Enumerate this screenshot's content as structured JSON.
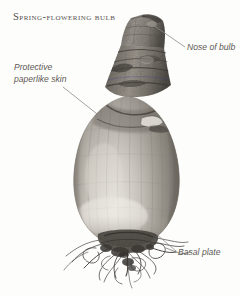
{
  "figure": {
    "title": "Spring-flowering bulb",
    "background_color": "#fdfdfc",
    "text_color": "#5d5955",
    "leader_line_color": "#8c8884"
  },
  "labels": [
    {
      "id": "nose",
      "text": "Nose of bulb",
      "line_from": [
        153,
        25
      ],
      "line_to": [
        185,
        47
      ]
    },
    {
      "id": "paperlike-skin",
      "line1": "Protective",
      "line2": "paperlike skin",
      "line_from": [
        106,
        121
      ],
      "line_to": [
        63,
        87
      ]
    },
    {
      "id": "basal-plate",
      "text": "Basal plate",
      "line_from": [
        155,
        233
      ],
      "line_to": [
        176,
        251
      ]
    }
  ],
  "specimen": {
    "name": "bulb",
    "parts": [
      "nose",
      "neck",
      "tunic",
      "body",
      "basal plate",
      "roots"
    ],
    "tone_light": "#d8d4cd",
    "tone_mid": "#9c9790",
    "tone_dark": "#4c4843",
    "root_color": "#514d48"
  }
}
